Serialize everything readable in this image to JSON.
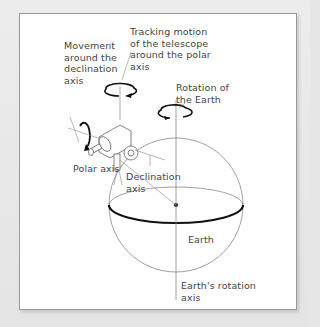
{
  "diagram": {
    "type": "equatorial telescope mount diagram",
    "labels": {
      "declination_movement": [
        "Movement",
        "around the",
        "declination",
        "axis"
      ],
      "tracking_motion": [
        "Tracking motion",
        "of the telescope",
        "around the polar",
        "axis"
      ],
      "earth_rotation": [
        "Rotation of",
        "the Earth"
      ],
      "polar_axis": "Polar axis",
      "declination_axis": [
        "Declination",
        "axis"
      ],
      "earth": "Earth",
      "earth_rotation_axis": [
        "Earth's rotation",
        "axis"
      ]
    },
    "colors": {
      "background": "#e6e6e6",
      "panel": "#ffffff",
      "line": "#777777",
      "equator": "#111111",
      "text": "#444444"
    }
  }
}
